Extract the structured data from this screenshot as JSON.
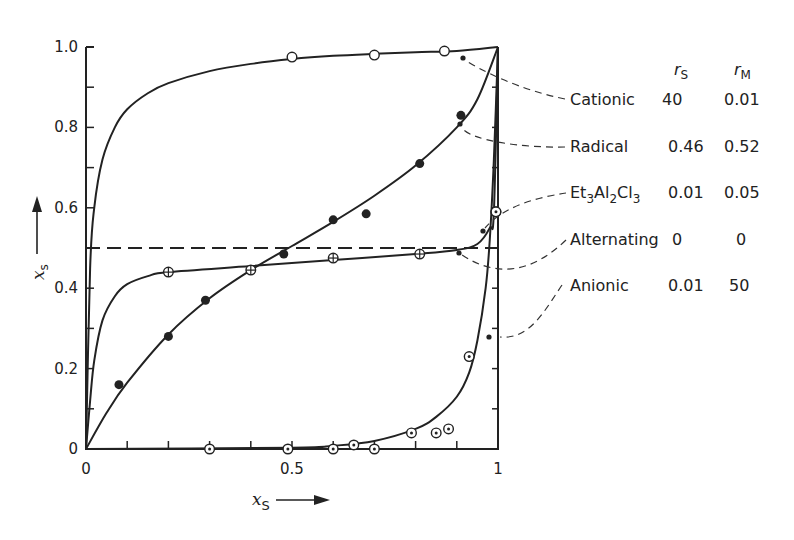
{
  "chart_data": {
    "type": "line",
    "title": "",
    "xlabel": "x_S",
    "ylabel": "x_s",
    "xlim": [
      0,
      1
    ],
    "ylim": [
      0,
      1
    ],
    "grid": false,
    "x_ticks": [
      {
        "value": 0,
        "label": "0"
      },
      {
        "value": 0.5,
        "label": "0.5"
      },
      {
        "value": 1,
        "label": "1"
      }
    ],
    "y_ticks": [
      {
        "value": 0,
        "label": "0"
      },
      {
        "value": 0.2,
        "label": "0.2"
      },
      {
        "value": 0.4,
        "label": "0.4"
      },
      {
        "value": 0.6,
        "label": "0.6"
      },
      {
        "value": 0.8,
        "label": "0.8"
      },
      {
        "value": 1.0,
        "label": "1.0"
      }
    ],
    "minor_tick_step": 0.1,
    "legend_position": "right, table with leader lines",
    "legend_headers": {
      "r_s": "r",
      "r_s_sub": "S",
      "r_m": "r",
      "r_m_sub": "M"
    },
    "series": [
      {
        "name": "Cationic",
        "label_main": "Cationic",
        "r_s": "40",
        "r_m": "0.01",
        "marker": "open-circle",
        "line": "solid",
        "curve": [
          [
            0,
            0
          ],
          [
            0.01,
            0.45
          ],
          [
            0.02,
            0.6
          ],
          [
            0.04,
            0.72
          ],
          [
            0.07,
            0.8
          ],
          [
            0.1,
            0.845
          ],
          [
            0.15,
            0.885
          ],
          [
            0.2,
            0.91
          ],
          [
            0.3,
            0.94
          ],
          [
            0.4,
            0.958
          ],
          [
            0.5,
            0.97
          ],
          [
            0.6,
            0.978
          ],
          [
            0.7,
            0.983
          ],
          [
            0.8,
            0.987
          ],
          [
            0.9,
            0.99
          ],
          [
            1,
            1
          ]
        ],
        "points": [
          [
            0.5,
            0.975
          ],
          [
            0.7,
            0.98
          ],
          [
            0.87,
            0.99
          ]
        ]
      },
      {
        "name": "Radical",
        "label_main": "Radical",
        "r_s": "0.46",
        "r_m": "0.52",
        "marker": "filled-circle",
        "line": "solid",
        "curve": [
          [
            0,
            0
          ],
          [
            0.05,
            0.09
          ],
          [
            0.1,
            0.165
          ],
          [
            0.2,
            0.285
          ],
          [
            0.3,
            0.375
          ],
          [
            0.4,
            0.445
          ],
          [
            0.5,
            0.505
          ],
          [
            0.6,
            0.565
          ],
          [
            0.7,
            0.63
          ],
          [
            0.8,
            0.705
          ],
          [
            0.9,
            0.8
          ],
          [
            0.95,
            0.87
          ],
          [
            1,
            1
          ]
        ],
        "points": [
          [
            0.08,
            0.16
          ],
          [
            0.2,
            0.28
          ],
          [
            0.29,
            0.37
          ],
          [
            0.48,
            0.485
          ],
          [
            0.6,
            0.57
          ],
          [
            0.68,
            0.585
          ],
          [
            0.81,
            0.71
          ],
          [
            0.91,
            0.83
          ]
        ]
      },
      {
        "name": "Et3Al2Cl3",
        "label_main": "Et",
        "label_sub1": "3",
        "label_mid": "Al",
        "label_sub2": "2",
        "label_end": "Cl",
        "label_sub3": "3",
        "r_s": "0.01",
        "r_m": "0.05",
        "marker": "circle-plus",
        "line": "solid",
        "curve": [
          [
            0,
            0
          ],
          [
            0.01,
            0.12
          ],
          [
            0.02,
            0.22
          ],
          [
            0.04,
            0.32
          ],
          [
            0.07,
            0.38
          ],
          [
            0.1,
            0.41
          ],
          [
            0.15,
            0.43
          ],
          [
            0.2,
            0.44
          ],
          [
            0.4,
            0.455
          ],
          [
            0.6,
            0.47
          ],
          [
            0.8,
            0.485
          ],
          [
            0.9,
            0.495
          ],
          [
            0.95,
            0.51
          ],
          [
            0.98,
            0.55
          ],
          [
            0.99,
            0.59
          ],
          [
            1,
            1
          ]
        ],
        "points": [
          [
            0.2,
            0.44
          ],
          [
            0.4,
            0.445
          ],
          [
            0.6,
            0.475
          ],
          [
            0.81,
            0.485
          ],
          [
            0.995,
            0.59
          ]
        ]
      },
      {
        "name": "Alternating",
        "label_main": "Alternating",
        "r_s": "0",
        "r_m": "0",
        "marker": "none",
        "line": "dashed",
        "curve": [
          [
            0,
            0.5
          ],
          [
            1,
            0.5
          ]
        ],
        "points": []
      },
      {
        "name": "Anionic",
        "label_main": "Anionic",
        "r_s": "0.01",
        "r_m": "50",
        "marker": "dot-circle",
        "line": "solid",
        "curve": [
          [
            0,
            0
          ],
          [
            0.5,
            0.003
          ],
          [
            0.6,
            0.008
          ],
          [
            0.7,
            0.02
          ],
          [
            0.8,
            0.05
          ],
          [
            0.85,
            0.08
          ],
          [
            0.9,
            0.13
          ],
          [
            0.93,
            0.19
          ],
          [
            0.95,
            0.27
          ],
          [
            0.97,
            0.4
          ],
          [
            0.98,
            0.52
          ],
          [
            0.99,
            0.72
          ],
          [
            1,
            1
          ]
        ],
        "points": [
          [
            0.3,
            0
          ],
          [
            0.49,
            0
          ],
          [
            0.6,
            0
          ],
          [
            0.65,
            0.01
          ],
          [
            0.7,
            0
          ],
          [
            0.79,
            0.04
          ],
          [
            0.85,
            0.04
          ],
          [
            0.88,
            0.05
          ],
          [
            0.93,
            0.23
          ],
          [
            0.995,
            0.59
          ]
        ]
      }
    ]
  }
}
